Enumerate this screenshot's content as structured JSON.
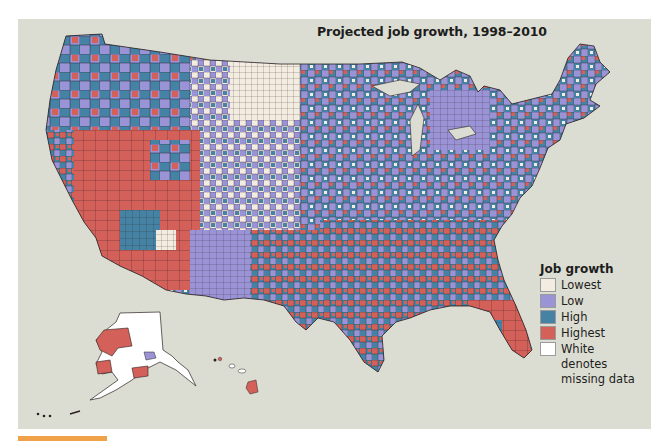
{
  "title": "Projected job growth, 1998–2010",
  "legend": {
    "title": "Job growth",
    "items": [
      {
        "label": "Lowest",
        "color": "#f3ece0"
      },
      {
        "label": "Low",
        "color": "#9a94d6"
      },
      {
        "label": "High",
        "color": "#4682a3"
      },
      {
        "label": "Highest",
        "color": "#d4605a"
      },
      {
        "label": "White denotes missing data",
        "color": "#ffffff"
      }
    ]
  },
  "colors": {
    "background": "#dcddd2",
    "border": "#3a2b2b",
    "accent_bar": "#f0a24a"
  },
  "map": {
    "regions": [
      "Contiguous United States",
      "Alaska",
      "Hawaii"
    ],
    "unit": "county"
  }
}
